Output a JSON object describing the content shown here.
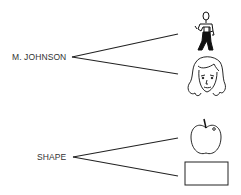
{
  "groups": [
    {
      "label": "M. JOHNSON",
      "items": [
        {
          "icon": "man-figure-icon"
        },
        {
          "icon": "woman-face-icon"
        }
      ]
    },
    {
      "label": "SHAPE",
      "items": [
        {
          "icon": "apple-icon"
        },
        {
          "icon": "rectangle-icon"
        }
      ]
    }
  ],
  "colors": {
    "stroke": "#222222",
    "text": "#333333",
    "background": "#ffffff"
  }
}
